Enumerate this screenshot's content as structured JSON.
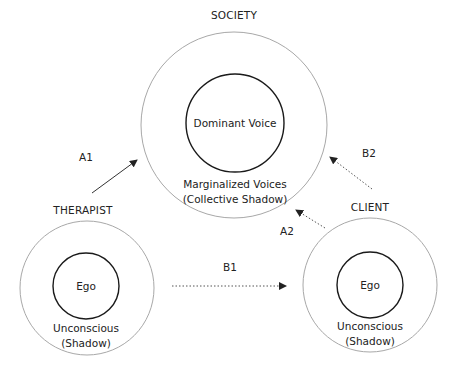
{
  "diagram": {
    "society": {
      "title": "SOCIETY",
      "inner_label": "Dominant Voice",
      "outer_label_line1": "Marginalized Voices",
      "outer_label_line2": "(Collective Shadow)"
    },
    "therapist": {
      "title": "THERAPIST",
      "inner_label": "Ego",
      "outer_label_line1": "Unconscious",
      "outer_label_line2": "(Shadow)"
    },
    "client": {
      "title": "CLIENT",
      "inner_label": "Ego",
      "outer_label_line1": "Unconscious",
      "outer_label_line2": "(Shadow)"
    },
    "arrows": {
      "a1": {
        "label": "A1",
        "style": "solid",
        "from": "therapist",
        "to": "society"
      },
      "a2": {
        "label": "A2",
        "style": "dotted",
        "from": "client",
        "to": "society"
      },
      "b1": {
        "label": "B1",
        "style": "dotted",
        "from": "therapist",
        "to": "client"
      },
      "b2": {
        "label": "B2",
        "style": "dotted",
        "from": "client",
        "to": "society"
      }
    },
    "colors": {
      "outer_circle": "#a8a8a8",
      "inner_circle": "#1a1a1a",
      "text": "#222222",
      "arrow": "#333333"
    }
  }
}
